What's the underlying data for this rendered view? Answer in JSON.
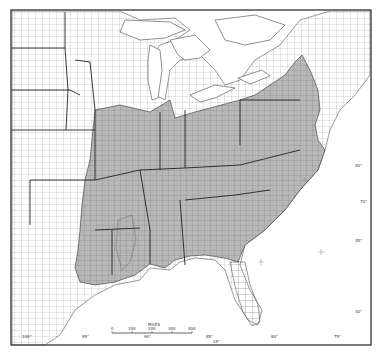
{
  "map": {
    "title": "",
    "region": "Eastern United States (county boundaries)",
    "colors": {
      "background": "#ffffff",
      "frame": "#222222",
      "shaded": "#b8b8b8",
      "unshaded": "#ffffff",
      "county_line": "#777777",
      "state_line": "#222222"
    },
    "scale_bar": {
      "title": "MILES",
      "ticks": [
        "0",
        "100",
        "200",
        "300",
        "400"
      ]
    },
    "longitude_labels": [
      "100°",
      "95°",
      "90°",
      "85°",
      "80°",
      "75°"
    ],
    "latitude_labels": [
      "40°",
      "35°",
      "30°",
      "25°"
    ],
    "misc_labels": [
      "25°",
      "70°"
    ]
  }
}
